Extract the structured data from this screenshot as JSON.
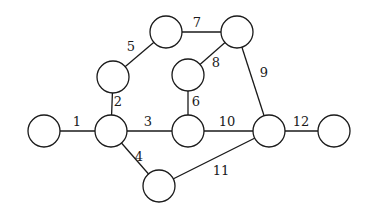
{
  "diagram": {
    "type": "undirected-graph",
    "node_radius": 16,
    "colors": {
      "stroke": "#1a1a1a",
      "fill": "#ffffff",
      "background": "#ffffff"
    },
    "nodes": [
      {
        "id": "A",
        "x": 44,
        "y": 131
      },
      {
        "id": "B",
        "x": 111,
        "y": 131
      },
      {
        "id": "C",
        "x": 113,
        "y": 77
      },
      {
        "id": "D",
        "x": 166,
        "y": 32
      },
      {
        "id": "E",
        "x": 237,
        "y": 32
      },
      {
        "id": "F",
        "x": 188,
        "y": 75
      },
      {
        "id": "G",
        "x": 188,
        "y": 131
      },
      {
        "id": "H",
        "x": 269,
        "y": 131
      },
      {
        "id": "I",
        "x": 334,
        "y": 131
      },
      {
        "id": "J",
        "x": 159,
        "y": 186
      }
    ],
    "edges": [
      {
        "label": "1",
        "from": "A",
        "to": "B",
        "lx": 77,
        "ly": 121
      },
      {
        "label": "2",
        "from": "B",
        "to": "C",
        "lx": 118,
        "ly": 101
      },
      {
        "label": "3",
        "from": "B",
        "to": "G",
        "lx": 148,
        "ly": 121
      },
      {
        "label": "4",
        "from": "B",
        "to": "J",
        "lx": 139,
        "ly": 156
      },
      {
        "label": "5",
        "from": "C",
        "to": "D",
        "lx": 131,
        "ly": 46
      },
      {
        "label": "6",
        "from": "F",
        "to": "G",
        "lx": 196,
        "ly": 101
      },
      {
        "label": "7",
        "from": "D",
        "to": "E",
        "lx": 197,
        "ly": 22
      },
      {
        "label": "8",
        "from": "F",
        "to": "E",
        "lx": 216,
        "ly": 62
      },
      {
        "label": "9",
        "from": "E",
        "to": "H",
        "lx": 264,
        "ly": 72
      },
      {
        "label": "10",
        "from": "G",
        "to": "H",
        "lx": 227,
        "ly": 121
      },
      {
        "label": "11",
        "from": "J",
        "to": "H",
        "lx": 221,
        "ly": 170
      },
      {
        "label": "12",
        "from": "H",
        "to": "I",
        "lx": 301,
        "ly": 121
      }
    ]
  }
}
